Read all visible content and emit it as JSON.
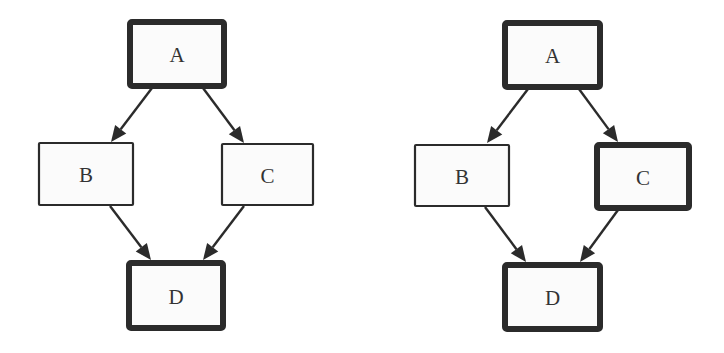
{
  "colors": {
    "background": "#ffffff",
    "node_fill": "#fbfbfb",
    "stroke": "#2b2b2b",
    "text": "#333333"
  },
  "diagrams": [
    {
      "name": "left-graph",
      "nodes": [
        {
          "id": "A",
          "label": "A",
          "x": 130,
          "y": 22,
          "w": 94,
          "h": 64,
          "emphasis": "thick"
        },
        {
          "id": "B",
          "label": "B",
          "x": 39,
          "y": 143,
          "w": 94,
          "h": 62,
          "emphasis": "thin"
        },
        {
          "id": "C",
          "label": "C",
          "x": 222,
          "y": 144,
          "w": 91,
          "h": 61,
          "emphasis": "thin"
        },
        {
          "id": "D",
          "label": "D",
          "x": 129,
          "y": 263,
          "w": 94,
          "h": 65,
          "emphasis": "thick"
        }
      ],
      "edges": [
        {
          "from": "A",
          "to": "B",
          "x1": 152,
          "y1": 88,
          "x2": 111,
          "y2": 142
        },
        {
          "from": "A",
          "to": "C",
          "x1": 203,
          "y1": 88,
          "x2": 244,
          "y2": 143
        },
        {
          "from": "B",
          "to": "D",
          "x1": 110,
          "y1": 206,
          "x2": 151,
          "y2": 260
        },
        {
          "from": "C",
          "to": "D",
          "x1": 244,
          "y1": 206,
          "x2": 203,
          "y2": 260
        }
      ]
    },
    {
      "name": "right-graph",
      "nodes": [
        {
          "id": "A",
          "label": "A",
          "x": 505,
          "y": 23,
          "w": 95,
          "h": 64,
          "emphasis": "thick"
        },
        {
          "id": "B",
          "label": "B",
          "x": 415,
          "y": 145,
          "w": 94,
          "h": 61,
          "emphasis": "thin"
        },
        {
          "id": "C",
          "label": "C",
          "x": 597,
          "y": 145,
          "w": 92,
          "h": 63,
          "emphasis": "thick"
        },
        {
          "id": "D",
          "label": "D",
          "x": 505,
          "y": 265,
          "w": 95,
          "h": 64,
          "emphasis": "thick"
        }
      ],
      "edges": [
        {
          "from": "A",
          "to": "B",
          "x1": 528,
          "y1": 89,
          "x2": 487,
          "y2": 143
        },
        {
          "from": "A",
          "to": "C",
          "x1": 579,
          "y1": 89,
          "x2": 618,
          "y2": 142
        },
        {
          "from": "B",
          "to": "D",
          "x1": 485,
          "y1": 207,
          "x2": 526,
          "y2": 262
        },
        {
          "from": "C",
          "to": "D",
          "x1": 618,
          "y1": 210,
          "x2": 580,
          "y2": 262
        }
      ]
    }
  ]
}
